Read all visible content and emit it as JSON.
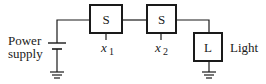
{
  "diagram": {
    "power_supply_label_line1": "Power",
    "power_supply_label_line2": "supply",
    "switch1": {
      "label": "S",
      "input_var": "x",
      "input_sub": "1"
    },
    "switch2": {
      "label": "S",
      "input_var": "x",
      "input_sub": "2"
    },
    "light": {
      "label": "L",
      "caption": "Light"
    }
  }
}
